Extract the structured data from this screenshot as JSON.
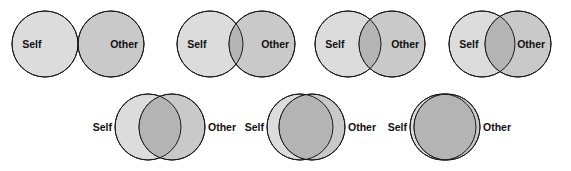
{
  "figure": {
    "name": "inclusion-of-other-in-the-self-scale",
    "background_color": "#ffffff",
    "width": 571,
    "height": 171
  },
  "style": {
    "self_fill": "#dcdcdc",
    "other_fill": "#c9c9c9",
    "overlap_fill": "#b4b4b4",
    "stroke": "#1a1a1a",
    "stroke_width": 1,
    "label_color": "#111111",
    "label_font_size": 10.5,
    "radius": 33
  },
  "labels": {
    "self": "Self",
    "other": "Other"
  },
  "chart_data": {
    "type": "diagram",
    "categories": [
      "1",
      "2",
      "3",
      "4",
      "5",
      "6",
      "7"
    ],
    "values": [
      0,
      14,
      22,
      30,
      42,
      54,
      62
    ],
    "ylabel": "Overlap (px of circle diameter 66)",
    "xlabel": "Scale step",
    "items": [
      {
        "step": 1,
        "row": 1,
        "label_placement": "inside",
        "self_cx": 45,
        "other_cx": 111,
        "cy": 44,
        "r": 33,
        "overlap_px": 0,
        "self_label": "Self",
        "other_label": "Other"
      },
      {
        "step": 2,
        "row": 1,
        "label_placement": "inside",
        "self_cx": 210,
        "other_cx": 262,
        "cy": 44,
        "r": 33,
        "overlap_px": 14,
        "self_label": "Self",
        "other_label": "Other"
      },
      {
        "step": 3,
        "row": 1,
        "label_placement": "inside",
        "self_cx": 348,
        "other_cx": 392,
        "cy": 44,
        "r": 33,
        "overlap_px": 22,
        "self_label": "Self",
        "other_label": "Other"
      },
      {
        "step": 4,
        "row": 1,
        "label_placement": "inside",
        "self_cx": 482,
        "other_cx": 518,
        "cy": 44,
        "r": 33,
        "overlap_px": 30,
        "self_label": "Self",
        "other_label": "Other"
      },
      {
        "step": 5,
        "row": 2,
        "label_placement": "outside",
        "self_cx": 148,
        "other_cx": 172,
        "cy": 127,
        "r": 33,
        "overlap_px": 42,
        "self_label": "Self",
        "other_label": "Other"
      },
      {
        "step": 6,
        "row": 2,
        "label_placement": "outside",
        "self_cx": 300,
        "other_cx": 312,
        "cy": 127,
        "r": 33,
        "overlap_px": 54,
        "self_label": "Self",
        "other_label": "Other"
      },
      {
        "step": 7,
        "row": 2,
        "label_placement": "outside",
        "self_cx": 443,
        "other_cx": 447,
        "cy": 127,
        "r": 33,
        "overlap_px": 62,
        "self_label": "Self",
        "other_label": "Other"
      }
    ]
  }
}
